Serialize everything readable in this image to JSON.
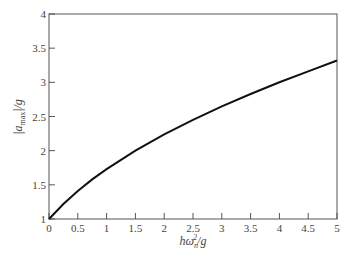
{
  "chart_data": {
    "type": "line",
    "title": "",
    "xlabel": "hω²ₙ/g",
    "ylabel": "|a_max|/g",
    "xlim": [
      0,
      5
    ],
    "ylim": [
      1,
      4
    ],
    "grid": false,
    "x_ticks": [
      "0",
      "0.5",
      "1",
      "1.5",
      "2",
      "2.5",
      "3",
      "3.5",
      "4",
      "4.5",
      "5"
    ],
    "y_ticks": [
      "1",
      "1.5",
      "2",
      "2.5",
      "3",
      "3.5",
      "4"
    ],
    "series": [
      {
        "name": "|a_max|/g",
        "x": [
          0,
          0.25,
          0.5,
          0.75,
          1,
          1.5,
          2,
          2.5,
          3,
          3.5,
          4,
          4.5,
          5
        ],
        "values": [
          1.0,
          1.22,
          1.41,
          1.58,
          1.73,
          2.0,
          2.24,
          2.45,
          2.65,
          2.83,
          3.0,
          3.16,
          3.32
        ]
      }
    ]
  }
}
